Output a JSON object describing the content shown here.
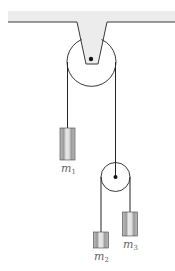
{
  "diagram": {
    "masses": [
      {
        "id": "m1",
        "label": "m",
        "sub": "1"
      },
      {
        "id": "m2",
        "label": "m",
        "sub": "2"
      },
      {
        "id": "m3",
        "label": "m",
        "sub": "3"
      }
    ],
    "colors": {
      "ceiling": "#ececec",
      "line": "#222222",
      "mass_fill": "#c8c8c8",
      "mass_stripe": "#e6e6e6",
      "label": "#666666"
    }
  }
}
